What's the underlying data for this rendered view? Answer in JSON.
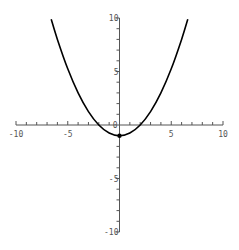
{
  "chart_data": {
    "type": "line",
    "title": "",
    "xlabel": "",
    "ylabel": "",
    "xlim": [
      -10,
      10
    ],
    "ylim": [
      -10,
      10
    ],
    "grid": false,
    "function": "y = x^2/4 - 1",
    "series": [
      {
        "name": "curve",
        "color": "#000000",
        "x": [
          -6.6,
          -6,
          -5,
          -4,
          -3,
          -2,
          -1,
          0,
          1,
          2,
          3,
          4,
          5,
          6,
          6.6
        ],
        "y": [
          9.89,
          8,
          5.25,
          3,
          1.25,
          0,
          -0.75,
          -1,
          -0.75,
          0,
          1.25,
          3,
          5.25,
          8,
          9.89
        ]
      }
    ],
    "marked_points": [
      {
        "x": 0,
        "y": -1
      }
    ],
    "x_tick_labels": [
      "-10",
      "-5",
      "5",
      "10"
    ],
    "x_tick_values": [
      -10,
      -5,
      5,
      10
    ],
    "y_tick_labels": [
      "10",
      "5",
      "-5",
      "-10"
    ],
    "y_tick_values": [
      10,
      5,
      -5,
      -10
    ],
    "origin_label": "0",
    "axis_color": "#555555"
  }
}
